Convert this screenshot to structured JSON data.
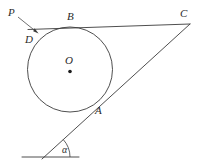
{
  "figure": {
    "background_color": "#ffffff",
    "stroke_color": "#3b3b3b",
    "width": 203,
    "height": 163,
    "labels": {
      "point_p": "P",
      "point_d": "D",
      "point_b": "B",
      "point_c": "C",
      "point_o": "O",
      "point_a": "A",
      "angle_alpha": "α"
    },
    "geometry": {
      "circle": {
        "cx": 70,
        "cy": 69.5,
        "r": 42.5
      },
      "center_dot": {
        "cx": 70,
        "cy": 71.5,
        "r": 1.8
      },
      "tangent_top": {
        "x1": 28,
        "y1": 29.5,
        "x2": 190,
        "y2": 24
      },
      "tangent_oblique": {
        "x1": 42,
        "y1": 159,
        "x2": 190,
        "y2": 24
      },
      "baseline": {
        "x1": 22,
        "y1": 157,
        "x2": 79,
        "y2": 157
      },
      "angle_arc": {
        "cx": 44,
        "cy": 157,
        "r": 26,
        "start_deg": 0,
        "end_deg": -42
      },
      "leader_p_to_d": {
        "x1": 18,
        "y1": 17,
        "x2": 37,
        "y2": 32
      },
      "arrow_tip": {
        "x": 38.5,
        "y": 33.5
      }
    },
    "label_positions": {
      "point_p": {
        "x": 8,
        "y": 16
      },
      "point_d": {
        "x": 25,
        "y": 43
      },
      "point_b": {
        "x": 67,
        "y": 20
      },
      "point_c": {
        "x": 180,
        "y": 17
      },
      "point_o": {
        "x": 65,
        "y": 64
      },
      "point_a": {
        "x": 95,
        "y": 114
      },
      "angle_alpha": {
        "x": 62,
        "y": 153
      }
    }
  }
}
